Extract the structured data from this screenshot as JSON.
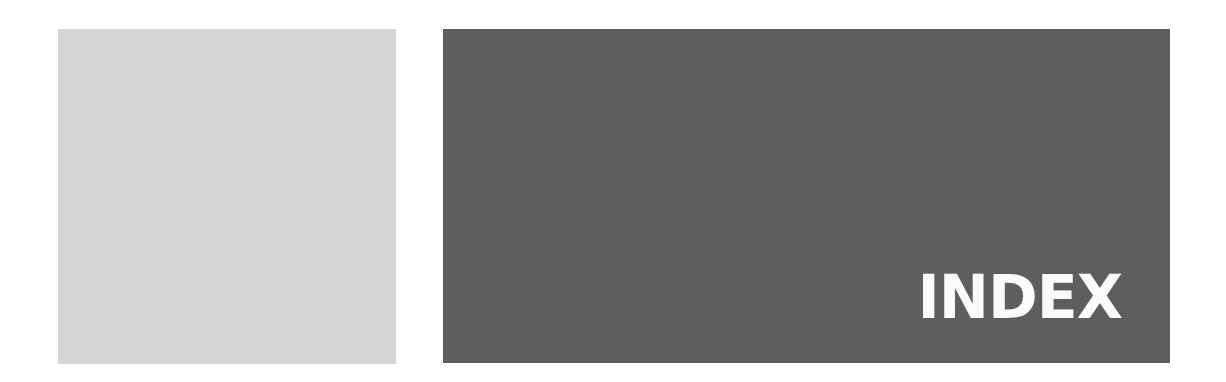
{
  "page": {
    "title": "INDEX",
    "colors": {
      "light_panel": "#d5d5d5",
      "dark_panel": "#5e5e5e",
      "title_text": "#fbfbfb"
    }
  }
}
